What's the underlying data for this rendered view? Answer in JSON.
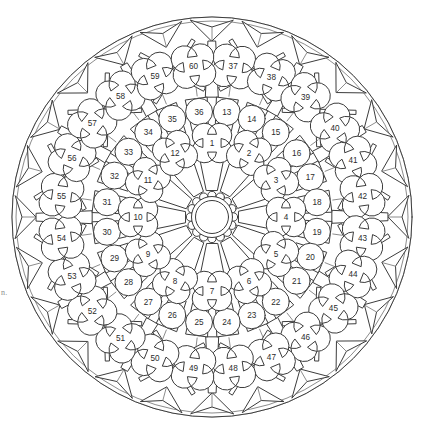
{
  "figure": {
    "type": "rose-window-tracery-plan",
    "canvas": {
      "width": 423,
      "height": 429
    },
    "center": {
      "x": 212,
      "y": 217
    },
    "colors": {
      "background": "#ffffff",
      "stroke": "#3c3c3c",
      "stroke_light": "#6e6e6e",
      "fill": "#ffffff",
      "number_text": "#2b2b2b"
    },
    "edge_artifact_text": "n."
  },
  "geometry": {
    "hub": {
      "inner_circle_radius": 16.5,
      "outer_circle_radius": 20.5,
      "bump_count": 16,
      "bump_radius": 4.2,
      "bump_orbit_radius": 21.5
    },
    "rings": [
      {
        "name": "spoke-wedges",
        "inner_radius": 26,
        "outer_radius": 62,
        "count": 12,
        "shape": "wedge"
      },
      {
        "name": "ring-1-quatrefoils",
        "radius": 74,
        "count": 12,
        "shape": "quatrefoil",
        "lobe": 12.5,
        "numbers_start": 1
      },
      {
        "name": "ring-2-wedges",
        "inner_radius": 88,
        "outer_radius": 120,
        "count": 24,
        "shape": "wedge"
      },
      {
        "name": "ring-2-circles",
        "radius": 106,
        "count": 24,
        "shape": "circle",
        "circle_radius": 13.5,
        "numbers_start": 13
      },
      {
        "name": "ring-3-bands",
        "inner_radius": 124,
        "outer_radius": 166,
        "count": 12,
        "shape": "radial-band"
      },
      {
        "name": "ring-3-quatrefoils",
        "radius": 152,
        "count": 24,
        "shape": "quatrefoil",
        "lobe": 13.5,
        "numbers_start": 37
      },
      {
        "name": "perimeter-darts",
        "radius": 188,
        "count": 24,
        "shape": "dart"
      }
    ],
    "guide_circles": [
      58,
      64,
      86,
      122,
      128,
      170,
      176,
      200
    ]
  },
  "rings": {
    "inner_quatrefoils": {
      "label": "Inner ring (quatrefoils)",
      "shape": "quatrefoil",
      "count": 12,
      "numbers": [
        1,
        2,
        3,
        4,
        5,
        6,
        7,
        8,
        9,
        10,
        11,
        12
      ]
    },
    "middle_circles": {
      "label": "Middle ring (circles)",
      "shape": "circle",
      "count": 24,
      "numbers": [
        13,
        14,
        15,
        16,
        17,
        18,
        19,
        20,
        21,
        22,
        23,
        24,
        25,
        26,
        27,
        28,
        29,
        30,
        31,
        32,
        33,
        34,
        35,
        36
      ]
    },
    "outer_quatrefoils": {
      "label": "Outer ring (quatrefoils)",
      "shape": "quatrefoil",
      "count": 24,
      "numbers": [
        37,
        38,
        39,
        40,
        41,
        42,
        43,
        44,
        45,
        46,
        47,
        48,
        49,
        50,
        51,
        52,
        53,
        54,
        55,
        56,
        57,
        58,
        59,
        60
      ]
    }
  },
  "panels": [
    {
      "n": "1",
      "ring": "inner",
      "shape": "quatrefoil",
      "angle_deg": -90,
      "radius": 74,
      "label_x": 212,
      "label_y": 133
    },
    {
      "n": "2",
      "ring": "inner",
      "shape": "quatrefoil",
      "angle_deg": -60,
      "radius": 74,
      "label_x": 249,
      "label_y": 153
    },
    {
      "n": "3",
      "ring": "inner",
      "shape": "quatrefoil",
      "angle_deg": -30,
      "radius": 74,
      "label_x": 276,
      "label_y": 180
    },
    {
      "n": "4",
      "ring": "inner",
      "shape": "quatrefoil",
      "angle_deg": 0,
      "radius": 74,
      "label_x": 297,
      "label_y": 217
    },
    {
      "n": "5",
      "ring": "inner",
      "shape": "quatrefoil",
      "angle_deg": 30,
      "radius": 74,
      "label_x": 285,
      "label_y": 267
    },
    {
      "n": "6",
      "ring": "inner",
      "shape": "quatrefoil",
      "angle_deg": 60,
      "radius": 74,
      "label_x": 254,
      "label_y": 291
    },
    {
      "n": "7",
      "ring": "inner",
      "shape": "quatrefoil",
      "angle_deg": 90,
      "radius": 74,
      "label_x": 210,
      "label_y": 313
    },
    {
      "n": "8",
      "ring": "inner",
      "shape": "quatrefoil",
      "angle_deg": 120,
      "radius": 74,
      "label_x": 168,
      "label_y": 299
    },
    {
      "n": "9",
      "ring": "inner",
      "shape": "quatrefoil",
      "angle_deg": 150,
      "radius": 74,
      "label_x": 135,
      "label_y": 265
    },
    {
      "n": "10",
      "ring": "inner",
      "shape": "quatrefoil",
      "angle_deg": 180,
      "radius": 74,
      "label_x": 123,
      "label_y": 220
    },
    {
      "n": "11",
      "ring": "inner",
      "shape": "quatrefoil",
      "angle_deg": -150,
      "radius": 74,
      "label_x": 135,
      "label_y": 175
    },
    {
      "n": "12",
      "ring": "inner",
      "shape": "quatrefoil",
      "angle_deg": -120,
      "radius": 74,
      "label_x": 165,
      "label_y": 143
    },
    {
      "n": "13",
      "ring": "middle",
      "shape": "circle",
      "angle_deg": -82,
      "radius": 106,
      "label_x": 227,
      "label_y": 94
    },
    {
      "n": "14",
      "ring": "middle",
      "shape": "circle",
      "angle_deg": -68,
      "radius": 106,
      "label_x": 256,
      "label_y": 103
    },
    {
      "n": "15",
      "ring": "middle",
      "shape": "circle",
      "angle_deg": -53,
      "radius": 106,
      "label_x": 286,
      "label_y": 120
    },
    {
      "n": "16",
      "ring": "middle",
      "shape": "circle",
      "angle_deg": -37,
      "radius": 106,
      "label_x": 310,
      "label_y": 145
    },
    {
      "n": "17",
      "ring": "middle",
      "shape": "circle",
      "angle_deg": -22,
      "radius": 106,
      "label_x": 325,
      "label_y": 174
    },
    {
      "n": "18",
      "ring": "middle",
      "shape": "circle",
      "angle_deg": -8,
      "radius": 106,
      "label_x": 335,
      "label_y": 205
    },
    {
      "n": "19",
      "ring": "middle",
      "shape": "circle",
      "angle_deg": 8,
      "radius": 106,
      "label_x": 332,
      "label_y": 240
    },
    {
      "n": "20",
      "ring": "middle",
      "shape": "circle",
      "angle_deg": 22,
      "radius": 106,
      "label_x": 323,
      "label_y": 270
    },
    {
      "n": "21",
      "ring": "middle",
      "shape": "circle",
      "angle_deg": 37,
      "radius": 106,
      "label_x": 306,
      "label_y": 294
    },
    {
      "n": "22",
      "ring": "middle",
      "shape": "circle",
      "angle_deg": 53,
      "radius": 106,
      "label_x": 284,
      "label_y": 318
    },
    {
      "n": "23",
      "ring": "middle",
      "shape": "circle",
      "angle_deg": 68,
      "radius": 106,
      "label_x": 256,
      "label_y": 336
    },
    {
      "n": "24",
      "ring": "middle",
      "shape": "circle",
      "angle_deg": 82,
      "radius": 106,
      "label_x": 228,
      "label_y": 345
    },
    {
      "n": "25",
      "ring": "middle",
      "shape": "circle",
      "angle_deg": 97,
      "radius": 106,
      "label_x": 193,
      "label_y": 347
    },
    {
      "n": "26",
      "ring": "middle",
      "shape": "circle",
      "angle_deg": 112,
      "radius": 106,
      "label_x": 164,
      "label_y": 336
    },
    {
      "n": "27",
      "ring": "middle",
      "shape": "circle",
      "angle_deg": 127,
      "radius": 106,
      "label_x": 136,
      "label_y": 318
    },
    {
      "n": "28",
      "ring": "middle",
      "shape": "circle",
      "angle_deg": 142,
      "radius": 106,
      "label_x": 113,
      "label_y": 296
    },
    {
      "n": "29",
      "ring": "middle",
      "shape": "circle",
      "angle_deg": 157,
      "radius": 106,
      "label_x": 96,
      "label_y": 271
    },
    {
      "n": "30",
      "ring": "middle",
      "shape": "circle",
      "angle_deg": 172,
      "radius": 106,
      "label_x": 88,
      "label_y": 239
    },
    {
      "n": "31",
      "ring": "middle",
      "shape": "circle",
      "angle_deg": -172,
      "radius": 106,
      "label_x": 89,
      "label_y": 204
    },
    {
      "n": "32",
      "ring": "middle",
      "shape": "circle",
      "angle_deg": -157,
      "radius": 106,
      "label_x": 97,
      "label_y": 175
    },
    {
      "n": "33",
      "ring": "middle",
      "shape": "circle",
      "angle_deg": -142,
      "radius": 106,
      "label_x": 113,
      "label_y": 146
    },
    {
      "n": "34",
      "ring": "middle",
      "shape": "circle",
      "angle_deg": -127,
      "radius": 106,
      "label_x": 138,
      "label_y": 120
    },
    {
      "n": "35",
      "ring": "middle",
      "shape": "circle",
      "angle_deg": -112,
      "radius": 106,
      "label_x": 165,
      "label_y": 103
    },
    {
      "n": "36",
      "ring": "middle",
      "shape": "circle",
      "angle_deg": -97,
      "radius": 106,
      "label_x": 196,
      "label_y": 93
    },
    {
      "n": "37",
      "ring": "outer",
      "shape": "quatrefoil",
      "angle_deg": -82,
      "radius": 152,
      "label_x": 235,
      "label_y": 50
    },
    {
      "n": "38",
      "ring": "outer",
      "shape": "quatrefoil",
      "angle_deg": -67,
      "radius": 152,
      "label_x": 275,
      "label_y": 61
    },
    {
      "n": "39",
      "ring": "outer",
      "shape": "quatrefoil",
      "angle_deg": -52,
      "radius": 152,
      "label_x": 313,
      "label_y": 84
    },
    {
      "n": "40",
      "ring": "outer",
      "shape": "quatrefoil",
      "angle_deg": -36,
      "radius": 152,
      "label_x": 344,
      "label_y": 118
    },
    {
      "n": "41",
      "ring": "outer",
      "shape": "quatrefoil",
      "angle_deg": -22,
      "radius": 152,
      "label_x": 365,
      "label_y": 158
    },
    {
      "n": "42",
      "ring": "outer",
      "shape": "quatrefoil",
      "angle_deg": -8,
      "radius": 152,
      "label_x": 380,
      "label_y": 200
    },
    {
      "n": "43",
      "ring": "outer",
      "shape": "quatrefoil",
      "angle_deg": 8,
      "radius": 152,
      "label_x": 379,
      "label_y": 244
    },
    {
      "n": "44",
      "ring": "outer",
      "shape": "quatrefoil",
      "angle_deg": 22,
      "radius": 152,
      "label_x": 369,
      "label_y": 287
    },
    {
      "n": "45",
      "ring": "outer",
      "shape": "quatrefoil",
      "angle_deg": 37,
      "radius": 152,
      "label_x": 346,
      "label_y": 327
    },
    {
      "n": "46",
      "ring": "outer",
      "shape": "quatrefoil",
      "angle_deg": 52,
      "radius": 152,
      "label_x": 313,
      "label_y": 357
    },
    {
      "n": "47",
      "ring": "outer",
      "shape": "quatrefoil",
      "angle_deg": 67,
      "radius": 152,
      "label_x": 274,
      "label_y": 381
    },
    {
      "n": "48",
      "ring": "outer",
      "shape": "quatrefoil",
      "angle_deg": 82,
      "radius": 152,
      "label_x": 232,
      "label_y": 392
    },
    {
      "n": "49",
      "ring": "outer",
      "shape": "quatrefoil",
      "angle_deg": 97,
      "radius": 152,
      "label_x": 189,
      "label_y": 392
    },
    {
      "n": "50",
      "ring": "outer",
      "shape": "quatrefoil",
      "angle_deg": 112,
      "radius": 152,
      "label_x": 147,
      "label_y": 381
    },
    {
      "n": "51",
      "ring": "outer",
      "shape": "quatrefoil",
      "angle_deg": 127,
      "radius": 152,
      "label_x": 107,
      "label_y": 357
    },
    {
      "n": "52",
      "ring": "outer",
      "shape": "quatrefoil",
      "angle_deg": 142,
      "radius": 152,
      "label_x": 76,
      "label_y": 324
    },
    {
      "n": "53",
      "ring": "outer",
      "shape": "quatrefoil",
      "angle_deg": 157,
      "radius": 152,
      "label_x": 54,
      "label_y": 286
    },
    {
      "n": "54",
      "ring": "outer",
      "shape": "quatrefoil",
      "angle_deg": 172,
      "radius": 152,
      "label_x": 43,
      "label_y": 241
    },
    {
      "n": "55",
      "ring": "outer",
      "shape": "quatrefoil",
      "angle_deg": -172,
      "radius": 152,
      "label_x": 44,
      "label_y": 198
    },
    {
      "n": "56",
      "ring": "outer",
      "shape": "quatrefoil",
      "angle_deg": -157,
      "radius": 152,
      "label_x": 57,
      "label_y": 154
    },
    {
      "n": "57",
      "ring": "outer",
      "shape": "quatrefoil",
      "angle_deg": -142,
      "radius": 152,
      "label_x": 78,
      "label_y": 120
    },
    {
      "n": "58",
      "ring": "outer",
      "shape": "quatrefoil",
      "angle_deg": -127,
      "radius": 152,
      "label_x": 110,
      "label_y": 84
    },
    {
      "n": "59",
      "ring": "outer",
      "shape": "quatrefoil",
      "angle_deg": -112,
      "radius": 152,
      "label_x": 147,
      "label_y": 68
    },
    {
      "n": "60",
      "ring": "outer",
      "shape": "quatrefoil",
      "angle_deg": -97,
      "radius": 152,
      "label_x": 190,
      "label_y": 49
    }
  ]
}
